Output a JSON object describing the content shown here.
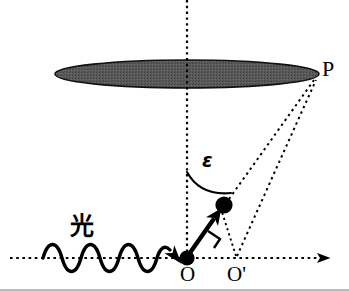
{
  "figure": {
    "type": "physics-scattering-diagram",
    "background_color": "#ffffff",
    "stroke_color": "#000000",
    "disk_fill_color": "#595959",
    "width": 349,
    "height": 291
  },
  "labels": {
    "observation_point": "P",
    "origin": "O",
    "origin_prime": "O'",
    "angle_symbol": "ε",
    "incident_light": "光"
  },
  "geometry": {
    "disk": {
      "cx": 187,
      "cy": 74,
      "rx": 132,
      "ry": 14
    },
    "vertical_axis": {
      "x": 187,
      "y1": 0,
      "y2": 258
    },
    "horizontal_axis": {
      "y": 258,
      "x1": 10,
      "x2": 335
    },
    "point_O": {
      "x": 187,
      "y": 258
    },
    "point_O_prime": {
      "x": 237,
      "y": 258
    },
    "point_P": {
      "x": 315,
      "y": 78
    },
    "dipole": {
      "x": 224,
      "y": 205,
      "r": 8
    },
    "dipole_arrow": {
      "x1": 187,
      "y1": 258,
      "x2": 224,
      "y2": 205
    },
    "right_angle_marker": {
      "x": 216,
      "y": 237
    },
    "angle_arc": {
      "from_x": 187,
      "from_y": 172,
      "to_x": 231,
      "to_y": 194
    },
    "wave": {
      "x_start": 43,
      "x_end": 176,
      "baseline_y": 258,
      "amplitude": 12,
      "cycles": 3.5
    }
  },
  "annotations": {
    "dotted_ray_dipole_to_P": "dipole → P",
    "dotted_ray_Oprime_to_P": "O' → P",
    "dotted_segment_Oprime_to_dipole": "O' → dipole"
  }
}
